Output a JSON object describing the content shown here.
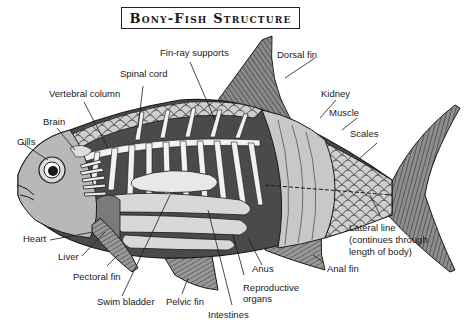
{
  "title": "Bony-Fish Structure",
  "labels": {
    "fin_ray_supports": "Fin-ray supports",
    "dorsal_fin": "Dorsal fin",
    "spinal_cord": "Spinal cord",
    "vertebral_column": "Vertebral column",
    "kidney": "Kidney",
    "muscle": "Muscle",
    "brain": "Brain",
    "scales": "Scales",
    "gills": "Gills",
    "heart": "Heart",
    "liver": "Liver",
    "pectoral_fin": "Pectoral fin",
    "swim_bladder": "Swim bladder",
    "pelvic_fin": "Pelvic fin",
    "intestines": "Intestines",
    "reproductive_organs_1": "Reproductive",
    "reproductive_organs_2": "organs",
    "anus": "Anus",
    "anal_fin": "Anal fin",
    "lateral_line_1": "Lateral line",
    "lateral_line_2": "(continues through",
    "lateral_line_3": "length of body)"
  },
  "colors": {
    "outline": "#1a1a1a",
    "dark_body": "#4a4a4a",
    "mid_gray": "#9a9a9a",
    "light_gray": "#d4d4d4",
    "white": "#ffffff"
  }
}
